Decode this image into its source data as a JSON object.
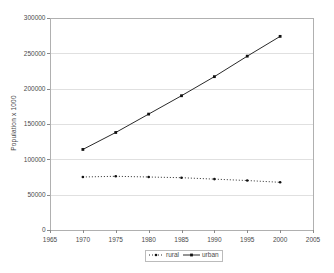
{
  "chart_data": {
    "type": "line",
    "title": "",
    "xlabel": "",
    "ylabel": "Population x 1000",
    "x": [
      1970,
      1975,
      1980,
      1985,
      1990,
      1995,
      2000
    ],
    "series": [
      {
        "name": "rural",
        "values": [
          75000,
          76000,
          75000,
          74000,
          72000,
          70000,
          67500
        ],
        "line_style": "dotted",
        "marker": "circle",
        "color": "#2a2a2a"
      },
      {
        "name": "urban",
        "values": [
          114000,
          138000,
          164000,
          190000,
          217000,
          246000,
          274000
        ],
        "line_style": "solid",
        "marker": "square",
        "color": "#2a2a2a"
      }
    ],
    "xlim": [
      1965,
      2005
    ],
    "ylim": [
      0,
      300000
    ],
    "xticks": [
      1965,
      1970,
      1975,
      1980,
      1985,
      1990,
      1995,
      2000,
      2005
    ],
    "xtick_labels": [
      "1965",
      "1970",
      "1975",
      "1980",
      "1985",
      "1990",
      "1995",
      "2000",
      "2005"
    ],
    "yticks": [
      0,
      50000,
      100000,
      150000,
      200000,
      250000,
      300000
    ],
    "ytick_labels": [
      "0",
      "50000",
      "100000",
      "150000",
      "200000",
      "250000",
      "300000"
    ],
    "grid": "horizontal",
    "legend_position": "bottom-center",
    "legend": [
      "rural",
      "urban"
    ]
  },
  "colors": {
    "background": "#ffffff",
    "plot_border": "#b0b0b0",
    "gridline": "#e0e0e0",
    "tick": "#8a8a8a",
    "text": "#4a4a4a",
    "marker": "#111111"
  }
}
